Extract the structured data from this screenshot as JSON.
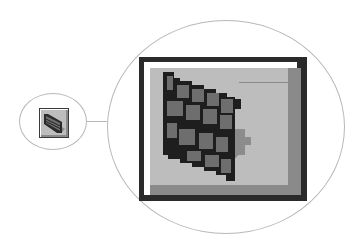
{
  "figure": {
    "icon": {
      "name": "brick-wall-icon",
      "colors": {
        "frame_dark": "#2a2a2a",
        "highlight": "#ffffff",
        "face": "#bdbdbd",
        "shadow": "#8a8a8a",
        "brick": "#6e6e6e",
        "mortar": "#1e1e1e",
        "brick_shadow": "#8c8c8c"
      }
    }
  }
}
